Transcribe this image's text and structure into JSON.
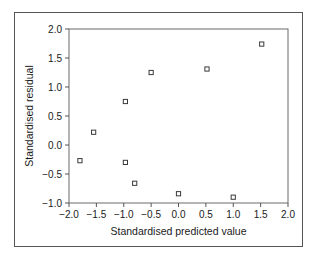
{
  "chart_data": {
    "type": "scatter",
    "title": "",
    "xlabel": "Standardised predicted value",
    "ylabel": "Standardised residual",
    "xlim": [
      -2.0,
      2.0
    ],
    "ylim": [
      -1.0,
      2.0
    ],
    "xticks": [
      "-2.0",
      "-1.5",
      "-1.0",
      "-0.5",
      "0.0",
      "0.5",
      "1.0",
      "1.5",
      "2.0"
    ],
    "xtick_values": [
      -2.0,
      -1.5,
      -1.0,
      -0.5,
      0.0,
      0.5,
      1.0,
      1.5,
      2.0
    ],
    "yticks": [
      "-1.0",
      "-0.5",
      "0.0",
      "0.5",
      "1.0",
      "1.5",
      "2.0"
    ],
    "ytick_values": [
      -1.0,
      -0.5,
      0.0,
      0.5,
      1.0,
      1.5,
      2.0
    ],
    "grid": false,
    "legend": false,
    "marker": "open-square",
    "marker_color": "#3a3a3a",
    "points": [
      {
        "x": -1.8,
        "y": -0.27
      },
      {
        "x": -1.55,
        "y": 0.22
      },
      {
        "x": -0.97,
        "y": 0.75
      },
      {
        "x": -0.97,
        "y": -0.3
      },
      {
        "x": -0.8,
        "y": -0.66
      },
      {
        "x": -0.5,
        "y": 1.25
      },
      {
        "x": 0.0,
        "y": -0.84
      },
      {
        "x": 0.52,
        "y": 1.31
      },
      {
        "x": 1.0,
        "y": -0.9
      },
      {
        "x": 1.52,
        "y": 1.74
      }
    ]
  },
  "style": {
    "axis_color": "#555555",
    "frame_color": "#555555",
    "text_color": "#1a1a1a",
    "background": "#ffffff"
  }
}
